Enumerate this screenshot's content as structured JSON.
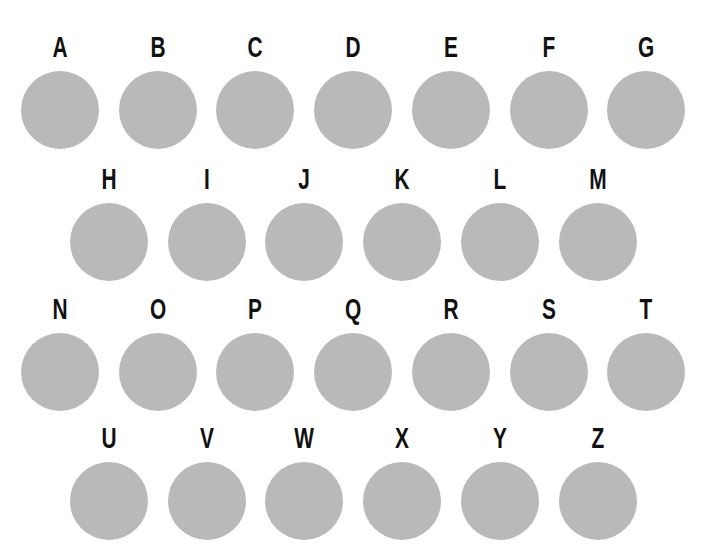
{
  "colors": {
    "disc": "#b9b9b9",
    "label": "#111111",
    "background": "#ffffff"
  },
  "rows": [
    {
      "letters": [
        "A",
        "B",
        "C",
        "D",
        "E",
        "F",
        "G"
      ]
    },
    {
      "letters": [
        "H",
        "I",
        "J",
        "K",
        "L",
        "M"
      ]
    },
    {
      "letters": [
        "N",
        "O",
        "P",
        "Q",
        "R",
        "S",
        "T"
      ]
    },
    {
      "letters": [
        "U",
        "V",
        "W",
        "X",
        "Y",
        "Z"
      ]
    }
  ]
}
